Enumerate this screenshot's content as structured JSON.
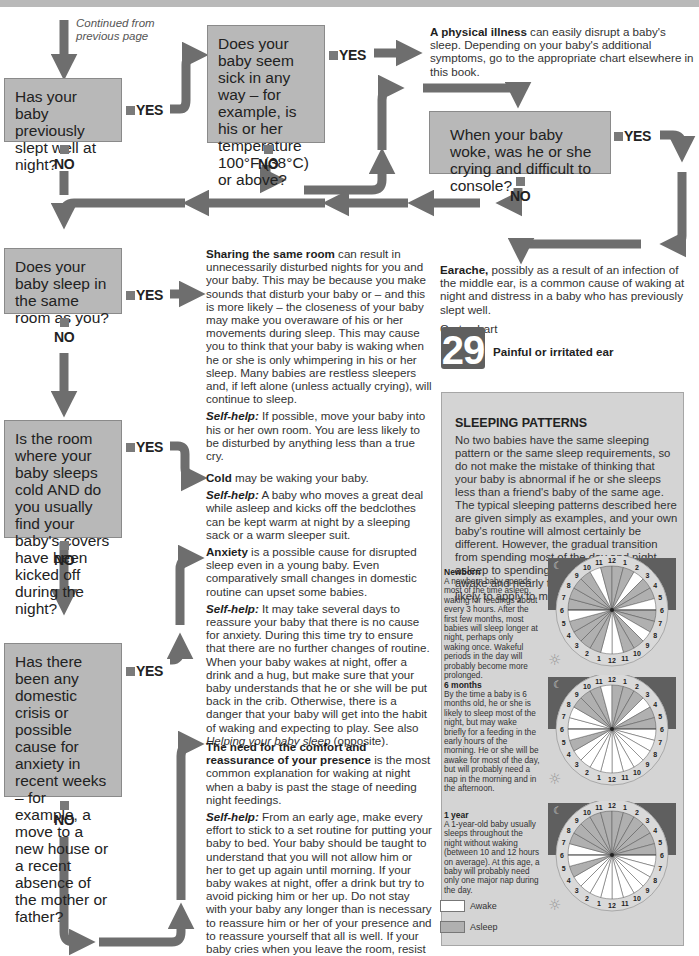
{
  "page": {
    "continued_note": "Continued from previous page",
    "colors": {
      "box_fill": "#b8b8b8",
      "arrow": "#6e6e6e",
      "panel_bg": "#d4d4d4",
      "night_band": "#5f5f5f",
      "asleep": "#b0b0b0",
      "awake": "#ffffff"
    }
  },
  "labels": {
    "yes": "YES",
    "no": "NO"
  },
  "questions": [
    {
      "id": "q1",
      "text": "Has your baby previously slept well at night?"
    },
    {
      "id": "q2",
      "text": "Does your baby seem sick in any way – for example, is his or her temperature 100°F (38°C) or above?"
    },
    {
      "id": "q3",
      "text": "When your baby woke, was he or she crying and difficult to console?"
    },
    {
      "id": "q4",
      "text": "Does your baby sleep in the same room as you?"
    },
    {
      "id": "q5",
      "text": "Is the room where your baby sleeps cold AND do you usually find your baby's covers have been kicked off during the night?"
    },
    {
      "id": "q6",
      "text": "Has there been any domestic crisis or possible cause for anxiety in recent weeks – for example, a move to a new house or a recent absence of the mother or father?"
    }
  ],
  "answers": {
    "illness": {
      "bold": "A physical illness",
      "text": " can easily disrupt a baby's sleep. Depending on your baby's additional symptoms, go to the appropriate chart elsewhere in this book."
    },
    "earache": {
      "bold": "Earache,",
      "text": " possibly as a result of an infection of the middle ear, is a common cause of waking at night and distress in a baby who has previously slept well.",
      "goto": "Go to chart",
      "chart_number": "29",
      "chart_title": "Painful or irritated ear"
    },
    "sharing": {
      "bold": "Sharing the same room",
      "text": " can result in unnecessarily disturbed nights for you and your baby. This may be because you make sounds that disturb your baby or – and this is more likely – the closeness of your baby may make you overaware of his or her movements during sleep. This may cause you to think that your baby is waking when he or she is only whimpering in his or her sleep. Many babies are restless sleepers and, if left alone (unless actually crying), will continue to sleep.",
      "selfhelp_label": "Self-help:",
      "selfhelp": " If possible, move your baby into his or her own room. You are less likely to be disturbed by anything less than a true cry."
    },
    "cold": {
      "bold": "Cold",
      "text": " may be waking your baby.",
      "selfhelp_label": "Self-help:",
      "selfhelp": " A baby who moves a great deal while asleep and kicks off the bedclothes can be kept warm at night by a sleeping sack or a warm sleeper suit."
    },
    "anxiety": {
      "bold": "Anxiety",
      "text": " is a possible cause for disrupted sleep even in a young baby. Even comparatively small changes in domestic routine can upset some babies.",
      "selfhelp_label": "Self-help:",
      "selfhelp": " It may take several days to reassure your baby that there is no cause for anxiety. During this time try to ensure that there are no further changes of routine. When your baby wakes at night, offer a drink and a hug, but make sure that your baby understands that he or she will be put back in the crib. Otherwise, there is a danger that your baby will get into the habit of waking and expecting to play. See also ",
      "see_also": "Helping your baby sleep",
      "see_also_tail": " (opposite)."
    },
    "comfort": {
      "bold": "The need for the comfort and reassurance of your presence",
      "text": " is the most common explanation for waking at night when a baby is past the stage of needing night feedings.",
      "selfhelp_label": "Self-help:",
      "selfhelp": " From an early age, make every effort to stick to a set routine for putting your baby to bed. Your baby should be taught to understand that you will not allow him or her to get up again until morning. If your baby wakes at night, offer a drink but try to avoid picking him or her up. Do not stay with your baby any longer than is necessary to reassure him or her of your presence and to reassure yourself that all is well. If your baby cries when you leave the room, resist going back in. Crying for a few minutes will do your baby no harm and he or she will soon go back to sleep."
    }
  },
  "panel": {
    "title": "SLEEPING PATTERNS",
    "intro": "No two babies have the same sleeping pattern or the same sleep requirements, so do not make the mistake of thinking that your baby is abnormal if he or she sleeps less than a friend's baby of the same age. The typical sleeping patterns described here are given simply as examples, and your own baby's routine will almost certainly be different. However, the gradual transition from spending most of the day and night asleep to spending nearly the whole day awake and nearly the whole night asleep is likely to apply to most babies.",
    "stages": [
      {
        "title": "Newborn",
        "text": "A newborn baby spends most of the time asleep, waking for feedings about every 3 hours. After the first few months, most babies will sleep longer at night, perhaps only waking once. Wakeful periods in the day will probably become more prolonged."
      },
      {
        "title": "6 months",
        "text": "By the time a baby is 6 months old, he or she is likely to sleep most of the night, but may wake briefly for a feeding in the early hours of the morning. He or she will be awake for most of the day, but will probably need a nap in the morning and in the afternoon."
      },
      {
        "title": "1 year",
        "text": "A 1-year-old baby usually sleeps throughout the night without waking (between 10 and 12 hours on average). At this age, a baby will probably need only one major nap during the day."
      }
    ],
    "legend": [
      {
        "label": "Awake",
        "color": "#ffffff"
      },
      {
        "label": "Asleep",
        "color": "#b0b0b0"
      }
    ],
    "icons": {
      "night": "moon-icon",
      "day": "sun-icon"
    }
  },
  "chart_data": {
    "type": "pie",
    "hour_order": "clockwise starting at 6pm (left), through midnight (top), 6am (right), noon (bottom)",
    "clock_labels": [
      "6",
      "7",
      "8",
      "9",
      "10",
      "11",
      "12",
      "1",
      "2",
      "3",
      "4",
      "5",
      "6",
      "7",
      "8",
      "9",
      "10",
      "11",
      "12",
      "1",
      "2",
      "3",
      "4",
      "5"
    ],
    "series": [
      {
        "name": "Newborn",
        "awake_hours": [
          4,
          8,
          11,
          14,
          17,
          18,
          23
        ]
      },
      {
        "name": "6 months",
        "awake_hours": [
          0,
          1,
          5,
          9,
          12,
          13,
          14,
          15,
          16,
          17,
          18,
          19,
          20,
          21,
          23
        ]
      },
      {
        "name": "1 year",
        "awake_hours": [
          0,
          12,
          13,
          14,
          15,
          16,
          17,
          18,
          19,
          20,
          21,
          23
        ]
      }
    ]
  }
}
